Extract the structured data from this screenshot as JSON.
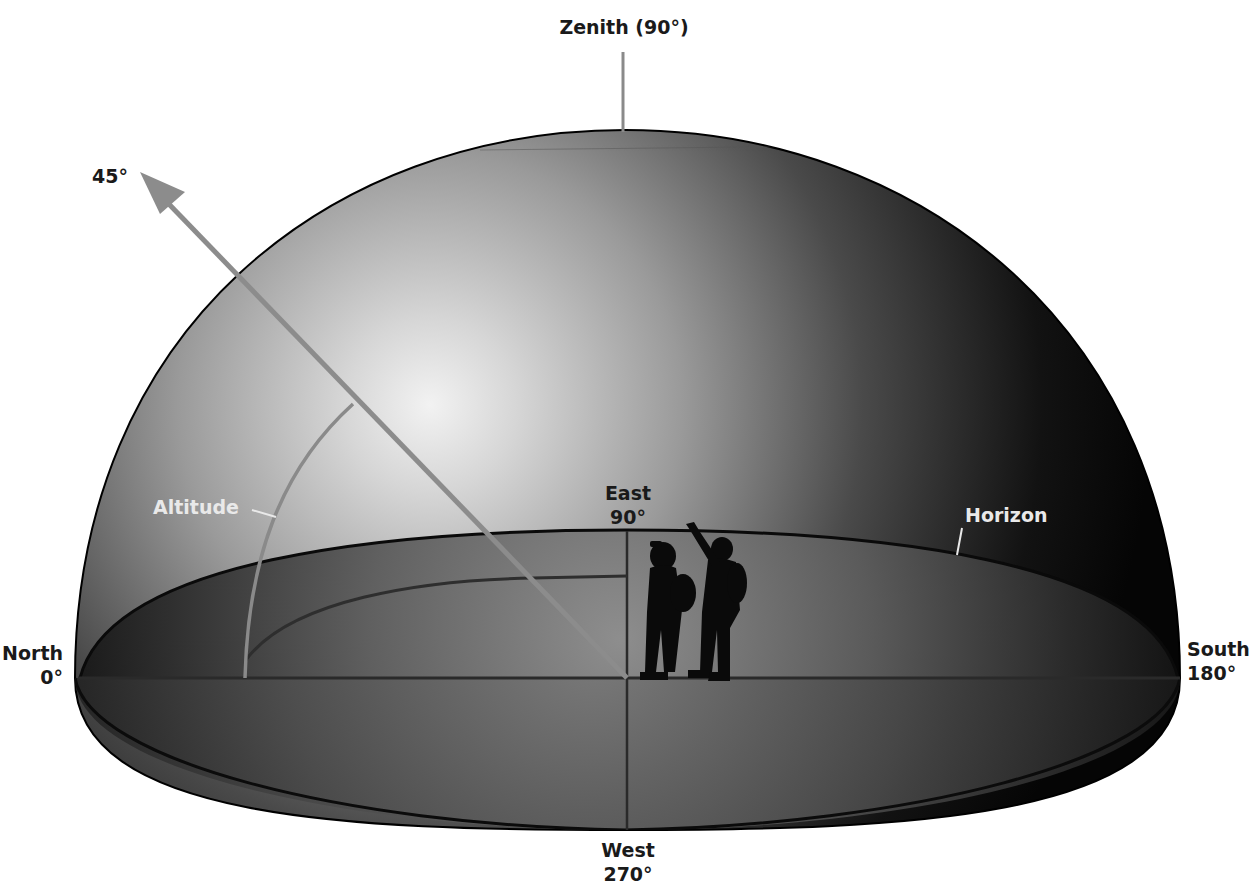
{
  "diagram": {
    "labels": {
      "zenith": "Zenith (90°)",
      "angle": "45°",
      "altitude": "Altitude",
      "horizon": "Horizon",
      "east_name": "East",
      "east_deg": "90°",
      "north_name": "North",
      "north_deg": "0°",
      "south_name": "South",
      "south_deg": "180°",
      "west_name": "West",
      "west_deg": "270°"
    },
    "colors": {
      "dome_dark": "#0d0d0d",
      "dome_light": "#e6e6e6",
      "arrow": "#8c8c8c",
      "guide_lines": "#3a3a3a",
      "label_dark": "#1a1a1a",
      "label_light": "#e9e9e9",
      "silhouette": "#0a0a0a"
    },
    "figures": [
      {
        "name": "observer-with-camera"
      },
      {
        "name": "observer-pointing"
      }
    ]
  }
}
